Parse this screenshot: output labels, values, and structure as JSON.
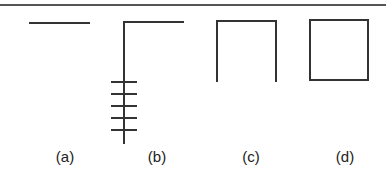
{
  "figure": {
    "stroke_color": "#333333",
    "panels": [
      {
        "id": "a",
        "label": "(a)",
        "shape": "single horizontal line"
      },
      {
        "id": "b",
        "label": "(b)",
        "shape": "inverted L with 5 tick marks on vertical stroke"
      },
      {
        "id": "c",
        "label": "(c)",
        "shape": "open square (three sides, bottom open)"
      },
      {
        "id": "d",
        "label": "(d)",
        "shape": "closed square"
      }
    ]
  }
}
